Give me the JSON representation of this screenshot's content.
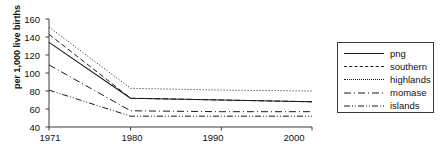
{
  "chart_data": {
    "type": "line",
    "title": "",
    "subtitle": "",
    "xlabel": "",
    "ylabel": "per 1,000 live births",
    "x": [
      1971,
      1980,
      1990,
      2000
    ],
    "xtick_labels": [
      "1971",
      "1980",
      "1990",
      "2000"
    ],
    "ytick_labels": [
      "40",
      "60",
      "80",
      "100",
      "120",
      "140",
      "160"
    ],
    "yticks": [
      40,
      60,
      80,
      100,
      120,
      140,
      160
    ],
    "ylim": [
      40,
      160
    ],
    "xlim": [
      1971,
      2000
    ],
    "grid": false,
    "legend_position": "right-outside",
    "series": [
      {
        "name": "png",
        "style": "solid",
        "values": [
          134,
          72,
          70,
          68
        ]
      },
      {
        "name": "southern",
        "style": "dashed",
        "values": [
          143,
          72,
          70,
          68
        ]
      },
      {
        "name": "highlands",
        "style": "dotted",
        "values": [
          151,
          83,
          81,
          80
        ]
      },
      {
        "name": "momase",
        "style": "dash-dot",
        "values": [
          109,
          58,
          57,
          57
        ]
      },
      {
        "name": "islands",
        "style": "dash-dot-dot",
        "values": [
          81,
          52,
          52,
          52
        ]
      }
    ]
  },
  "axis": {
    "ylabel": "per 1,000 live births",
    "ytick_labels": [
      "160",
      "140",
      "120",
      "100",
      "80",
      "60",
      "40"
    ],
    "xtick_labels": [
      "1971",
      "1980",
      "1990",
      "2000"
    ]
  },
  "legend": {
    "items": [
      {
        "label": "png",
        "style": "solid"
      },
      {
        "label": "southern",
        "style": "dashed"
      },
      {
        "label": "highlands",
        "style": "dotted"
      },
      {
        "label": "momase",
        "style": "dash-dot"
      },
      {
        "label": "islands",
        "style": "dash-dot-dot"
      }
    ]
  },
  "colors": {
    "line": "#1a1a1a",
    "axis": "#3a3a3a",
    "text": "#111111",
    "background": "#ffffff"
  }
}
